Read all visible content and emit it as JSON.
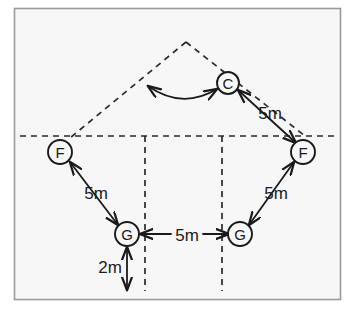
{
  "figure": {
    "background_color": "#f7f7f7",
    "page_color": "#ffffff",
    "stroke_color": "#1a1a1a",
    "frame": {
      "border_color": "#9a9a9a",
      "x": 14,
      "y": 8,
      "width": 327,
      "height": 292
    }
  },
  "nodes": [
    {
      "id": "node-c",
      "label": "C",
      "cx": 228,
      "cy": 83,
      "r": 11
    },
    {
      "id": "node-f-left",
      "label": "F",
      "cx": 60,
      "cy": 152,
      "r": 12
    },
    {
      "id": "node-f-right",
      "label": "F",
      "cx": 303,
      "cy": 152,
      "r": 12
    },
    {
      "id": "node-g-left",
      "label": "G",
      "cx": 127,
      "cy": 234,
      "r": 12
    },
    {
      "id": "node-g-right",
      "label": "G",
      "cx": 240,
      "cy": 234,
      "r": 12
    }
  ],
  "measurements": [
    {
      "id": "measure-c-f-right",
      "label": "5m",
      "x": 270,
      "y": 113
    },
    {
      "id": "measure-f-left-g-left",
      "label": "5m",
      "x": 96,
      "y": 193
    },
    {
      "id": "measure-f-right-g-right",
      "label": "5m",
      "x": 276,
      "y": 193
    },
    {
      "id": "measure-g-to-g",
      "label": "5m",
      "x": 187,
      "y": 235
    },
    {
      "id": "measure-g-left-down",
      "label": "2m",
      "x": 110,
      "y": 267
    }
  ],
  "guides": {
    "horizontal_axis": {
      "y": 136,
      "x1": 20,
      "x2": 338
    },
    "vertical_left": {
      "x": 145,
      "y1": 136,
      "y2": 291
    },
    "vertical_right": {
      "x": 222,
      "y1": 136,
      "y2": 291
    },
    "triangle_apex": {
      "x": 186,
      "y": 42
    },
    "triangle_left_base": {
      "x": 70,
      "y": 138
    },
    "triangle_right_base": {
      "x": 305,
      "y": 136
    }
  },
  "arrows": {
    "curved_c_to_apex_leg": {
      "from_x": 218,
      "from_y": 88,
      "to_x": 146,
      "to_y": 85,
      "double_headed": true
    }
  }
}
